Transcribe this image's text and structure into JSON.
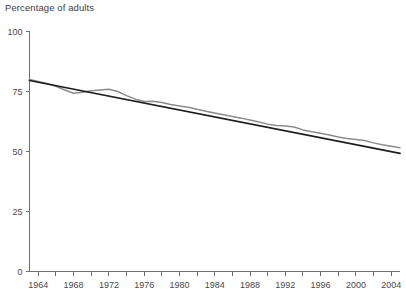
{
  "chart_data": {
    "type": "line",
    "title": "",
    "ylabel": "Percentage of adults",
    "xlabel": "",
    "ylim": [
      0,
      100
    ],
    "xlim": [
      1963,
      2005
    ],
    "yticks": [
      0,
      25,
      50,
      75,
      100
    ],
    "ytick_labels": [
      "0",
      "25",
      "50",
      "75",
      "100"
    ],
    "xticks": [
      1964,
      1966,
      1968,
      1970,
      1972,
      1974,
      1976,
      1978,
      1980,
      1982,
      1984,
      1986,
      1988,
      1990,
      1992,
      1994,
      1996,
      1998,
      2000,
      2002,
      2004
    ],
    "xtick_labels_shown": [
      "1964",
      "1968",
      "1972",
      "1976",
      "1980",
      "1984",
      "1988",
      "1992",
      "1996",
      "2000",
      "2004"
    ],
    "xtick_label_years": [
      1964,
      1968,
      1972,
      1976,
      1980,
      1984,
      1988,
      1992,
      1996,
      2000,
      2004
    ],
    "grid": false,
    "legend": "none",
    "series": [
      {
        "name": "Observed",
        "color": "#8c8c8c",
        "x": [
          1963,
          1964,
          1965,
          1966,
          1967,
          1968,
          1969,
          1970,
          1971,
          1972,
          1973,
          1974,
          1975,
          1976,
          1977,
          1978,
          1979,
          1980,
          1981,
          1982,
          1983,
          1984,
          1985,
          1986,
          1987,
          1988,
          1989,
          1990,
          1991,
          1992,
          1993,
          1994,
          1995,
          1996,
          1997,
          1998,
          1999,
          2000,
          2001,
          2002,
          2003,
          2004,
          2005
        ],
        "values": [
          80.0,
          79.2,
          78.3,
          77.2,
          75.6,
          74.3,
          74.7,
          75.3,
          75.6,
          75.9,
          75.0,
          73.3,
          71.8,
          70.8,
          70.9,
          70.4,
          69.6,
          69.0,
          68.4,
          67.6,
          66.8,
          66.0,
          65.3,
          64.6,
          63.9,
          63.1,
          62.3,
          61.4,
          60.8,
          60.6,
          60.2,
          59.0,
          58.2,
          57.6,
          56.9,
          56.0,
          55.4,
          55.0,
          54.6,
          53.6,
          52.8,
          52.2,
          51.6
        ]
      },
      {
        "name": "Trend",
        "color": "#1c1c1c",
        "x": [
          1963,
          2005
        ],
        "values": [
          79.6,
          49.2
        ]
      }
    ]
  },
  "meta": {
    "y_axis_caption": "Percentage of adults"
  }
}
